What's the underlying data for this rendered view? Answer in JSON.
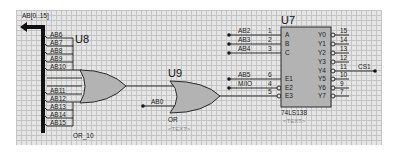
{
  "bus": {
    "label": "AB[0..15]"
  },
  "u8": {
    "ref": "U8",
    "part": "OR_10",
    "inputs": [
      "AB6",
      "AB7",
      "AB8",
      "AB9",
      "AB10",
      "AB11",
      "AB12",
      "AB13",
      "AB14",
      "AB15"
    ]
  },
  "u9": {
    "ref": "U9",
    "part": "OR",
    "text": "<TEXT>",
    "input_label": "AB0"
  },
  "u7": {
    "ref": "U7",
    "part": "74LS138",
    "text": "<TEXT>",
    "left_pins": [
      {
        "net": "AB2",
        "num": "1",
        "name": "A"
      },
      {
        "net": "AB3",
        "num": "2",
        "name": "B"
      },
      {
        "net": "AB4",
        "num": "3",
        "name": "C"
      },
      {
        "net": "AB5",
        "num": "6",
        "name": "E1"
      },
      {
        "net": "M/IO",
        "num": "4",
        "name": "E2"
      },
      {
        "net": "",
        "num": "5",
        "name": "E3"
      }
    ],
    "right_pins": [
      {
        "name": "Y0",
        "num": "15"
      },
      {
        "name": "Y1",
        "num": "14"
      },
      {
        "name": "Y2",
        "num": "13"
      },
      {
        "name": "Y3",
        "num": "12"
      },
      {
        "name": "Y4",
        "num": "11"
      },
      {
        "name": "Y5",
        "num": "10"
      },
      {
        "name": "Y6",
        "num": "9"
      },
      {
        "name": "Y7",
        "num": "7"
      }
    ],
    "output_net": "CS1"
  },
  "colors": {
    "grid_bg": "#e6e6e6",
    "grid_line": "#c4c4c4",
    "gate_fill": "#b3b3b3",
    "wire": "#2a2a2a"
  }
}
